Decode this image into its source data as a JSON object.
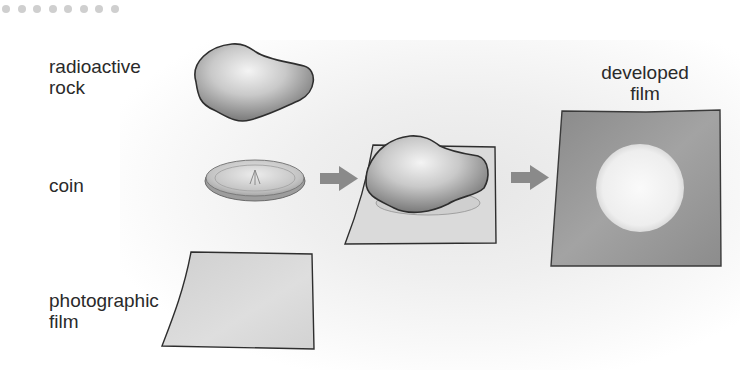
{
  "diagram": {
    "type": "process-flow",
    "labels": {
      "rock": [
        "radioactive",
        "rock"
      ],
      "coin": [
        "coin"
      ],
      "film": [
        "photographic",
        "film"
      ],
      "developed": [
        "developed",
        "film"
      ]
    },
    "coin_inscription": "TWO PENCE",
    "steps": [
      {
        "name": "components",
        "items": [
          "radioactive rock",
          "coin",
          "photographic film"
        ]
      },
      {
        "name": "assembly",
        "description": "rock placed on coin on film"
      },
      {
        "name": "result",
        "description": "developed film with light circular area where coin blocked radiation"
      }
    ],
    "arrows": 2,
    "colors": {
      "arrow": "#8a8a8a",
      "film": "#d6d6d6",
      "developed_film": "#8e8e8e",
      "exposed_spot": "#f2f2f2",
      "outline": "#333333",
      "text": "#2a2a2a",
      "dots": "#cfcfcf"
    }
  }
}
